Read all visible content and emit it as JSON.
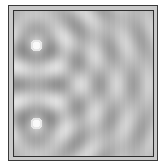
{
  "figure": {
    "type": "two-source wave interference pattern",
    "frame": {
      "outer_border_color": "#3a3a3a",
      "band_color": "#c8c8c8",
      "inner_border_color": "#2e2e2e"
    },
    "field": {
      "background_gray": "#b8b8b8",
      "bright_color": "#f4f4f4",
      "dark_color": "#8c8c8c"
    },
    "sources": [
      {
        "name": "upper-source",
        "x": 22,
        "y": 34
      },
      {
        "name": "lower-source",
        "x": 22,
        "y": 112
      }
    ],
    "wavelength_px": 30
  }
}
